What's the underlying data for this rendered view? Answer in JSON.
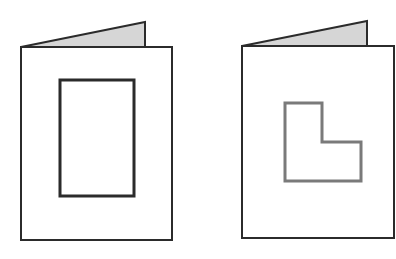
{
  "figure": {
    "width": 396,
    "height": 259,
    "background": "#ffffff",
    "colors": {
      "outline": "#2b2b2b",
      "flap_fill": "#d6d6d6",
      "l_shape_stroke": "#7a7a7a"
    },
    "cards": [
      {
        "name": "card-left",
        "front_rect": {
          "x": 21,
          "y": 47,
          "w": 151,
          "h": 193
        },
        "back_flap": "21,47 145,22 145,47",
        "aperture": {
          "shape": "rectangle",
          "x": 60,
          "y": 80,
          "w": 74,
          "h": 116
        }
      },
      {
        "name": "card-right",
        "front_rect": {
          "x": 242,
          "y": 46,
          "w": 152,
          "h": 192
        },
        "back_flap": "242,46 367,21 367,46",
        "aperture": {
          "shape": "l-shape",
          "points": "285,103 322,103 322,142 361,142 361,181 285,181"
        }
      }
    ]
  }
}
